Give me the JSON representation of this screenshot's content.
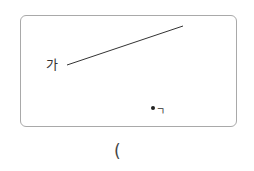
{
  "diagram": {
    "frame": {
      "border_color": "#a9a9a9"
    },
    "line_segment": {
      "x1": 67,
      "y1": 65,
      "x2": 183,
      "y2": 26,
      "color": "#333333"
    },
    "labels": {
      "line_start": "가",
      "point": "ㄱ"
    },
    "point": {
      "name": "point-giyeok"
    },
    "answer_blank": "("
  }
}
